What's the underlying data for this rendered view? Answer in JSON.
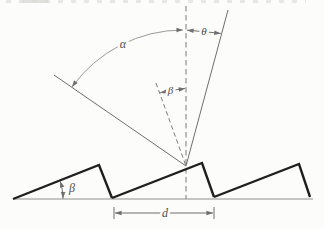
{
  "figure": {
    "labels": {
      "alpha": "α",
      "theta": "θ",
      "beta_normals": "β",
      "beta_blaze": "β",
      "spacing": "d"
    },
    "colors": {
      "background": "#fcfcfa",
      "ray_line": "#6f6f6f",
      "arc_line": "#9a9a9a",
      "dashed_line": "#7a7a7a",
      "tooth_line": "#1f1f1f",
      "baseline_line": "#8e8e8e",
      "label_text": "#4c4c4c"
    }
  }
}
